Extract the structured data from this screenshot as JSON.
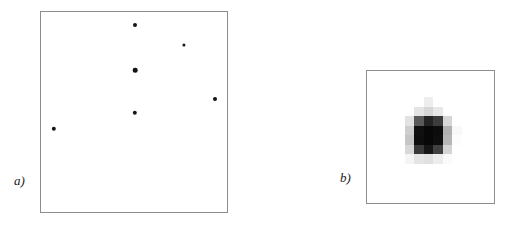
{
  "figure": {
    "width": 508,
    "height": 225,
    "background_color": "#ffffff"
  },
  "panels": [
    {
      "id": "a",
      "caption": "a)",
      "frame": {
        "x": 40,
        "y": 11,
        "width": 188,
        "height": 202
      },
      "border_color": "#8d8d8d",
      "background_color": "#ffffff",
      "content_type": "scatter-points",
      "point_color": "#141414"
    },
    {
      "id": "b",
      "caption": "b)",
      "frame": {
        "x": 366,
        "y": 70,
        "width": 129,
        "height": 134
      },
      "border_color": "#8d8d8d",
      "background_color": "#ffffff",
      "content_type": "pixel-heatmap"
    }
  ],
  "chart_data": [
    {
      "type": "scatter",
      "panel": "a",
      "title": "",
      "xlabel": "",
      "ylabel": "",
      "xlim": [
        0,
        188
      ],
      "ylim": [
        0,
        202
      ],
      "grid": false,
      "legend": null,
      "marker_color": "#141414",
      "points": [
        {
          "x": 94,
          "y": 13,
          "size": 4.0
        },
        {
          "x": 143,
          "y": 33,
          "size": 3.2
        },
        {
          "x": 94,
          "y": 58,
          "size": 4.6
        },
        {
          "x": 174,
          "y": 87,
          "size": 4.0
        },
        {
          "x": 94,
          "y": 101,
          "size": 4.4
        },
        {
          "x": 13,
          "y": 117,
          "size": 4.4
        }
      ]
    },
    {
      "type": "heatmap",
      "panel": "b",
      "title": "",
      "xlabel": "",
      "ylabel": "",
      "grid": false,
      "legend": null,
      "colormap": "grayscale-inverted",
      "cell_size": 9.5,
      "origin": {
        "x": 28,
        "y": 26
      },
      "rows": 7,
      "cols": 7,
      "value_range": [
        0,
        255
      ],
      "note": "values are 8-bit gray levels; 0 = black (brightest source), 255 = white (background)",
      "values": [
        [
          255,
          255,
          255,
          238,
          255,
          255,
          255
        ],
        [
          255,
          255,
          228,
          214,
          232,
          255,
          255
        ],
        [
          255,
          226,
          90,
          36,
          60,
          214,
          255
        ],
        [
          255,
          206,
          16,
          8,
          12,
          176,
          248
        ],
        [
          255,
          198,
          14,
          8,
          14,
          182,
          252
        ],
        [
          255,
          216,
          58,
          22,
          64,
          212,
          255
        ],
        [
          255,
          245,
          228,
          224,
          236,
          250,
          255
        ]
      ]
    }
  ]
}
